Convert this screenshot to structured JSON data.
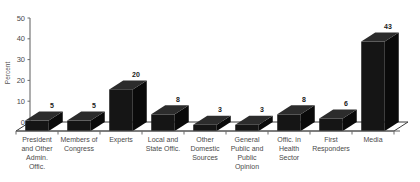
{
  "chart_data": {
    "type": "bar",
    "title": "",
    "xlabel": "",
    "ylabel": "Percent",
    "ylim": [
      0,
      50
    ],
    "yticks": [
      0,
      10,
      20,
      30,
      40,
      50
    ],
    "grid": false,
    "legend": "none",
    "style": "3d-column",
    "categories": [
      "President and Other Admin. Offic.",
      "Members of Congress",
      "Experts",
      "Local and State Offic.",
      "Other Domestic Sources",
      "General Public and Public Opinion",
      "Offic. in Health Sector",
      "First Responders",
      "Media"
    ],
    "category_lines": [
      [
        "President",
        "and Other",
        "Admin.",
        "Offic."
      ],
      [
        "Members of",
        "Congress"
      ],
      [
        "Experts"
      ],
      [
        "Local and",
        "State Offic."
      ],
      [
        "Other",
        "Domestic",
        "Sources"
      ],
      [
        "General",
        "Public and",
        "Public",
        "Opinion"
      ],
      [
        "Offic. in",
        "Health",
        "Sector"
      ],
      [
        "First",
        "Responders"
      ],
      [
        "Media"
      ]
    ],
    "values": [
      5,
      5,
      20,
      8,
      3,
      3,
      8,
      6,
      43
    ],
    "value_labels": [
      "5",
      "5",
      "20",
      "8",
      "3",
      "3",
      "8",
      "6",
      "43"
    ],
    "colors": {
      "bar_front": "#151515",
      "bar_top": "#2c2c2c",
      "bar_side": "#0a0a0a",
      "axis": "#5d5d5d",
      "text": "#4a4a4a",
      "background": "#ffffff"
    }
  }
}
